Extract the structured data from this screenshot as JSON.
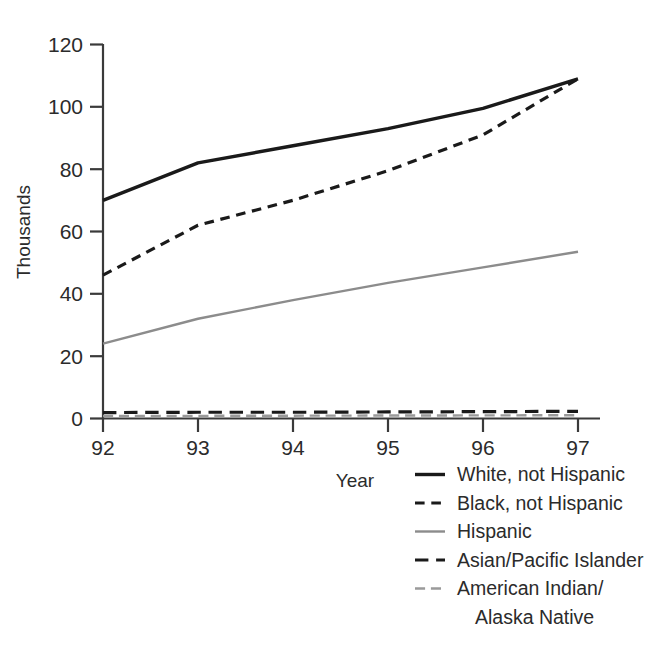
{
  "chart_data": {
    "type": "line",
    "title": "",
    "xlabel": "Year",
    "ylabel": "Thousands",
    "x": [
      92,
      93,
      94,
      95,
      96,
      97
    ],
    "xtick_labels": [
      "92",
      "93",
      "94",
      "95",
      "96",
      "97"
    ],
    "ytick_labels": [
      "0",
      "20",
      "40",
      "60",
      "80",
      "100",
      "120"
    ],
    "yticks": [
      0,
      20,
      40,
      60,
      80,
      100,
      120
    ],
    "xlim": [
      92,
      97
    ],
    "ylim": [
      0,
      120
    ],
    "grid": false,
    "legend_position": "bottom-right",
    "series": [
      {
        "name": "White, not Hispanic",
        "values": [
          70,
          82,
          87.5,
          93,
          99.5,
          109
        ],
        "color": "#1a1a1a",
        "style": "solid",
        "width": 3.4
      },
      {
        "name": "Black, not Hispanic",
        "values": [
          46,
          62,
          70,
          79.5,
          91,
          109
        ],
        "color": "#1a1a1a",
        "style": "dashed",
        "width": 3.2
      },
      {
        "name": "Hispanic",
        "values": [
          24,
          32,
          38,
          43.5,
          48.5,
          53.5
        ],
        "color": "#8c8c8c",
        "style": "solid",
        "width": 2.4
      },
      {
        "name": "Asian/Pacific Islander",
        "values": [
          1.9,
          2.0,
          2.0,
          2.1,
          2.2,
          2.3
        ],
        "color": "#1a1a1a",
        "style": "dashed-long",
        "width": 3.2
      },
      {
        "name": "American Indian/ Alaska Native",
        "values": [
          0.8,
          0.85,
          0.9,
          0.95,
          1.0,
          1.05
        ],
        "color": "#9a9a9a",
        "style": "dashed-long",
        "width": 2.4
      }
    ]
  },
  "axes": {
    "ylabel": "Thousands",
    "xlabel": "Year",
    "ytick_0": "0",
    "ytick_20": "20",
    "ytick_40": "40",
    "ytick_60": "60",
    "ytick_80": "80",
    "ytick_100": "100",
    "ytick_120": "120",
    "xtick_92": "92",
    "xtick_93": "93",
    "xtick_94": "94",
    "xtick_95": "95",
    "xtick_96": "96",
    "xtick_97": "97"
  },
  "legend": {
    "entries": [
      {
        "label": "White, not Hispanic",
        "line2": ""
      },
      {
        "label": "Black, not Hispanic",
        "line2": ""
      },
      {
        "label": "Hispanic",
        "line2": ""
      },
      {
        "label": "Asian/Pacific Islander",
        "line2": ""
      },
      {
        "label": "American Indian/",
        "line2": "Alaska Native"
      }
    ]
  },
  "colors": {
    "ink": "#1a1a1a",
    "gray_series": "#8c8c8c",
    "gray_series_light": "#9a9a9a",
    "axis": "#3a3a3a",
    "background": "#ffffff"
  }
}
